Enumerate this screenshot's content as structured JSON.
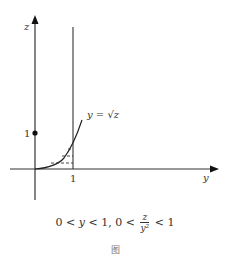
{
  "diagram": {
    "axes": {
      "vertical_label": "z",
      "horizontal_label": "y",
      "z_tick_label": "1",
      "y_tick_label": "1"
    },
    "curve_label": "y = √z",
    "caption": {
      "part1": "0 < ",
      "var_y": "y",
      "part2": " < 1, 0 < ",
      "frac_num": "z",
      "frac_den": "y²",
      "part3": " < 1"
    },
    "footer": "图",
    "colors": {
      "line": "#333333",
      "axis": "#222222"
    }
  }
}
